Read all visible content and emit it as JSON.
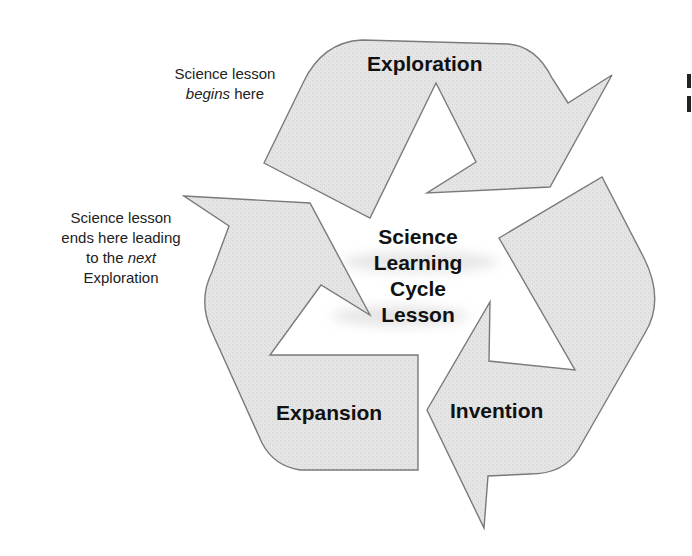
{
  "diagram": {
    "title_center": [
      "Science",
      "Learning",
      "Cycle",
      "Lesson"
    ],
    "stages": [
      {
        "id": "exploration",
        "label": "Exploration"
      },
      {
        "id": "invention",
        "label": "Invention"
      },
      {
        "id": "expansion",
        "label": "Expansion"
      }
    ],
    "annotations": {
      "begin": {
        "line1": "Science lesson",
        "line2_emph": "begins",
        "line2_rest": " here"
      },
      "end": {
        "line1": "Science lesson",
        "line2": "ends here leading",
        "line3_pre": "to the ",
        "line3_emph": "next",
        "line4": "Exploration"
      }
    },
    "colors": {
      "arrow_fill": "#e2e2e2",
      "arrow_stroke": "#7a7a7a",
      "text": "#111111",
      "background": "#ffffff"
    }
  }
}
